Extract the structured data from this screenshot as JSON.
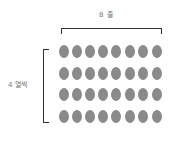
{
  "diagram": {
    "top_label": "8 줄",
    "left_label": "4 열씩",
    "rows": 4,
    "columns": 8,
    "dot_color": "#8a8a8a",
    "bracket_color": "#333333",
    "grid": {
      "column_centers_x": [
        64,
        77,
        90,
        103,
        116,
        130,
        143,
        157
      ],
      "row_centers_y": [
        51,
        73,
        94,
        116
      ]
    }
  }
}
